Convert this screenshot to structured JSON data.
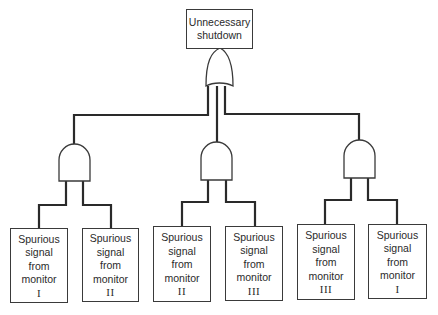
{
  "diagram": {
    "type": "fault-tree",
    "top_event": {
      "line1": "Unnecessary",
      "line2": "shutdown",
      "gate": "OR"
    },
    "intermediate_gates": [
      {
        "gate": "AND",
        "inputs": [
          0,
          1
        ]
      },
      {
        "gate": "AND",
        "inputs": [
          2,
          3
        ]
      },
      {
        "gate": "AND",
        "inputs": [
          4,
          5
        ]
      }
    ],
    "basic_events": [
      {
        "l1": "Spurious",
        "l2": "signal",
        "l3": "from",
        "l4": "monitor",
        "num": "I"
      },
      {
        "l1": "Spurious",
        "l2": "signal",
        "l3": "from",
        "l4": "monitor",
        "num": "II"
      },
      {
        "l1": "Spurious",
        "l2": "signal",
        "l3": "from",
        "l4": "monitor",
        "num": "II"
      },
      {
        "l1": "Spurious",
        "l2": "signal",
        "l3": "from",
        "l4": "monitor",
        "num": "III"
      },
      {
        "l1": "Spurious",
        "l2": "signal",
        "l3": "from",
        "l4": "monitor",
        "num": "III"
      },
      {
        "l1": "Spurious",
        "l2": "signal",
        "l3": "from",
        "l4": "monitor",
        "num": "I"
      }
    ],
    "colors": {
      "line": "#2a2a2a",
      "background": "#ffffff"
    }
  }
}
